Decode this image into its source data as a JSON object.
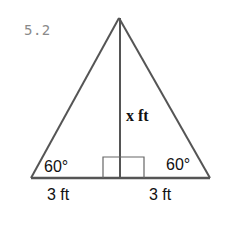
{
  "problem": {
    "number": "5.2"
  },
  "figure": {
    "type": "isosceles triangle with altitude",
    "vertices": {
      "apex": [
        119,
        18
      ],
      "base_left": [
        31,
        178
      ],
      "base_right": [
        210,
        178
      ]
    },
    "altitude": {
      "x": 120,
      "top": 18,
      "bottom": 178
    },
    "right_angle_box": {
      "x1": 103,
      "x2": 144,
      "y_top": 157,
      "y_bottom": 178
    },
    "stroke_color": "#555555",
    "labels": {
      "angle_left": "60°",
      "angle_right": "60°",
      "base_left": "3 ft",
      "base_right": "3 ft",
      "height": "x ft"
    }
  }
}
